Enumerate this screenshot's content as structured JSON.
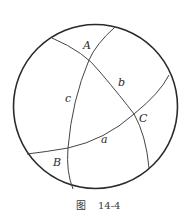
{
  "figure": {
    "caption_prefix": "图",
    "caption_number": "14-4",
    "sphere": {
      "cx": 95.5,
      "cy": 106.5,
      "r": 82,
      "stroke": "#2a2a2a"
    },
    "vertices": [
      {
        "name": "A",
        "label": "A"
      },
      {
        "name": "B",
        "label": "B"
      },
      {
        "name": "C",
        "label": "C"
      }
    ],
    "sides": [
      {
        "name": "a",
        "label": "a"
      },
      {
        "name": "b",
        "label": "b"
      },
      {
        "name": "c",
        "label": "c"
      }
    ]
  }
}
